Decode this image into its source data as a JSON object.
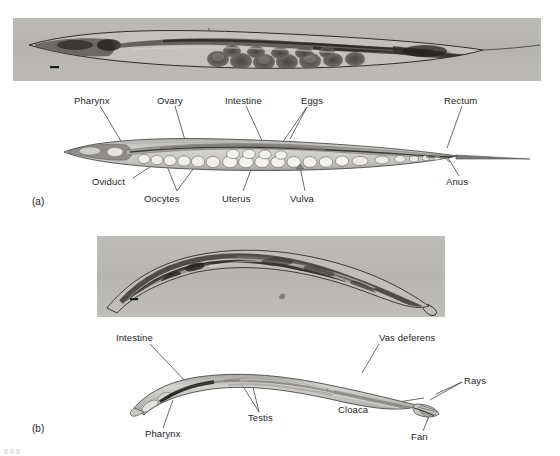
{
  "figure": {
    "panels": [
      {
        "id": "a",
        "letter": "(a)",
        "sex": "hermaphrodite",
        "micrograph": {
          "name": "hermaphrodite-micrograph",
          "caption": "",
          "scale_bar": true,
          "bounds": {
            "x": 13,
            "y": 18,
            "w": 528,
            "h": 63
          }
        },
        "diagram": {
          "name": "hermaphrodite-diagram",
          "bounds": {
            "x": 60,
            "y": 128,
            "w": 480,
            "h": 60
          }
        },
        "labels": [
          {
            "text": "Pharynx",
            "x": 74,
            "y": 101,
            "anchor": "start",
            "leader": [
              [
                100,
                113
              ],
              [
                121,
                141
              ]
            ]
          },
          {
            "text": "Ovary",
            "x": 157,
            "y": 101,
            "anchor": "start",
            "leader": [
              [
                174,
                113
              ],
              [
                186,
                146
              ]
            ]
          },
          {
            "text": "Intestine",
            "x": 225,
            "y": 101,
            "anchor": "start",
            "leader": [
              [
                248,
                113
              ],
              [
                265,
                144
              ]
            ]
          },
          {
            "text": "Eggs",
            "x": 303,
            "y": 101,
            "anchor": "start",
            "leader": [
              [
                304,
                113
              ],
              [
                281,
                145
              ]
            ]
          },
          {
            "text": "Rectum",
            "x": 445,
            "y": 101,
            "anchor": "start",
            "leader": [
              [
                462,
                113
              ],
              [
                446,
                148
              ]
            ]
          },
          {
            "text": "Oviduct",
            "x": 93,
            "y": 182,
            "anchor": "start",
            "leader": [
              [
                132,
                178
              ],
              [
                154,
                163
              ]
            ]
          },
          {
            "text": "Oocytes",
            "x": 145,
            "y": 199,
            "anchor": "start",
            "leader": [
              [
                176,
                192
              ],
              [
                168,
                166
              ]
            ]
          },
          {
            "text": "Uterus",
            "x": 223,
            "y": 199,
            "anchor": "start",
            "leader": [
              [
                243,
                192
              ],
              [
                252,
                166
              ]
            ]
          },
          {
            "text": "Vulva",
            "x": 291,
            "y": 199,
            "anchor": "start",
            "leader": [
              [
                305,
                192
              ],
              [
                299,
                166
              ]
            ]
          },
          {
            "text": "Anus",
            "x": 447,
            "y": 182,
            "anchor": "start",
            "leader": [
              [
                460,
                176
              ],
              [
                446,
                156
              ]
            ]
          }
        ]
      },
      {
        "id": "b",
        "letter": "(b)",
        "sex": "male",
        "micrograph": {
          "name": "male-micrograph",
          "caption": "",
          "scale_bar": true,
          "bounds": {
            "x": 97,
            "y": 236,
            "w": 348,
            "h": 81
          }
        },
        "diagram": {
          "name": "male-diagram",
          "bounds": {
            "x": 130,
            "y": 352,
            "w": 340,
            "h": 70
          }
        },
        "labels": [
          {
            "text": "Intestine",
            "x": 117,
            "y": 338,
            "anchor": "start",
            "leader": [
              [
                150,
                350
              ],
              [
                185,
                381
              ]
            ]
          },
          {
            "text": "Vas deferens",
            "x": 380,
            "y": 338,
            "anchor": "start",
            "leader": [
              [
                378,
                350
              ],
              [
                362,
                372
              ]
            ]
          },
          {
            "text": "Pharynx",
            "x": 146,
            "y": 434,
            "anchor": "start",
            "leader": [
              [
                163,
                425
              ],
              [
                172,
                400
              ]
            ]
          },
          {
            "text": "Testis",
            "x": 249,
            "y": 418,
            "anchor": "start",
            "leader": [
              [
                259,
                410
              ],
              [
                240,
                379
              ]
            ]
          },
          {
            "text": "Cloaca",
            "x": 339,
            "y": 410,
            "anchor": "start",
            "leader": [
              [
                371,
                406
              ],
              [
                422,
                398
              ]
            ]
          },
          {
            "text": "Rays",
            "x": 464,
            "y": 378,
            "anchor": "start",
            "leader": [
              [
                462,
                382
              ],
              [
                432,
                401
              ]
            ]
          },
          {
            "text": "Fan",
            "x": 412,
            "y": 437,
            "anchor": "start",
            "leader": [
              [
                424,
                428
              ],
              [
                432,
                408
              ]
            ]
          }
        ]
      }
    ],
    "colors": {
      "micrograph_background": "#b9b7b3",
      "diagram_body": "#c9c8c6",
      "diagram_outline": "#4a4a4a",
      "label_text": "#1d1d1d",
      "leader_line": "#3a3a3a",
      "page_background": "#ffffff",
      "egg_fill": "#efeeec",
      "gut_fill": "#9e9d9b"
    }
  }
}
